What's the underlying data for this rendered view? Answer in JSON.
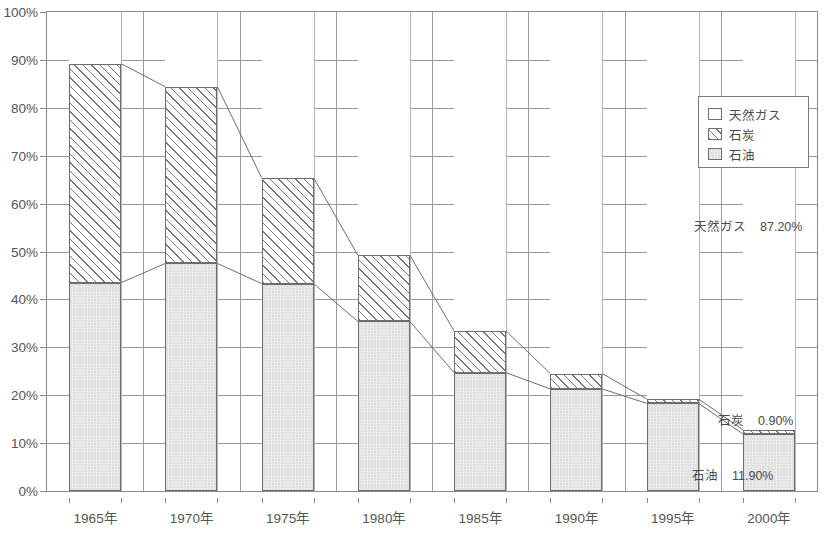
{
  "chart_data": {
    "type": "bar",
    "stacked": true,
    "title": "",
    "xlabel": "",
    "ylabel": "",
    "ylim": [
      0,
      100
    ],
    "ytick_step": 10,
    "grid": true,
    "legend_position": "inside-top-right",
    "categories": [
      "1965年",
      "1970年",
      "1975年",
      "1980年",
      "1985年",
      "1990年",
      "1995年",
      "2000年"
    ],
    "ytick_labels": [
      "0%",
      "10%",
      "20%",
      "30%",
      "40%",
      "50%",
      "60%",
      "70%",
      "80%",
      "90%",
      "100%"
    ],
    "series": [
      {
        "name": "石油",
        "key": "oil",
        "pattern": "dotted-gray",
        "color": "#e2e2e2",
        "values": [
          43.5,
          47.5,
          43.3,
          35.4,
          24.7,
          21.3,
          18.3,
          11.9
        ]
      },
      {
        "name": "石炭",
        "key": "coal",
        "pattern": "diagonal-hatch",
        "color": "#ffffff",
        "values": [
          45.7,
          36.9,
          22.1,
          13.8,
          8.7,
          3.2,
          0.9,
          0.9
        ]
      },
      {
        "name": "天然ガス",
        "key": "gas",
        "pattern": "solid-white",
        "color": "#ffffff",
        "values": [
          10.8,
          15.6,
          34.6,
          50.8,
          66.6,
          75.5,
          80.8,
          87.2
        ]
      }
    ],
    "series_cumulative_tops": {
      "oil": [
        43.5,
        47.5,
        43.3,
        35.4,
        24.7,
        21.3,
        18.3,
        11.9
      ],
      "coal": [
        89.2,
        84.4,
        65.4,
        49.2,
        33.4,
        24.5,
        19.2,
        12.8
      ]
    },
    "annotations": [
      {
        "name": "天然ガス",
        "value": "87.20%",
        "x_px": 694,
        "y_px": 216
      },
      {
        "name": "石炭",
        "value": "0.90%",
        "x_px": 718,
        "y_px": 410
      },
      {
        "name": "石油",
        "value": "11.90%",
        "x_px": 692,
        "y_px": 465
      }
    ]
  },
  "legend": {
    "items": [
      {
        "label": "天然ガス",
        "swatch": "solid-white"
      },
      {
        "label": "石炭",
        "swatch": "diagonal-hatch"
      },
      {
        "label": "石油",
        "swatch": "dotted-gray"
      }
    ]
  },
  "axes": {
    "y_labels": [
      "100%",
      "90%",
      "80%",
      "70%",
      "60%",
      "50%",
      "40%",
      "30%",
      "20%",
      "10%",
      "0%"
    ],
    "x_labels": [
      "1965年",
      "1970年",
      "1975年",
      "1980年",
      "1985年",
      "1990年",
      "1995年",
      "2000年"
    ]
  },
  "footer": {
    "source_note": ""
  },
  "colors": {
    "axis": "#8a8a8a",
    "grid": "#9a9a9a",
    "bar_border": "#6d6d6d",
    "oil_fill": "#e2e2e2",
    "text": "#4a4a4a"
  }
}
